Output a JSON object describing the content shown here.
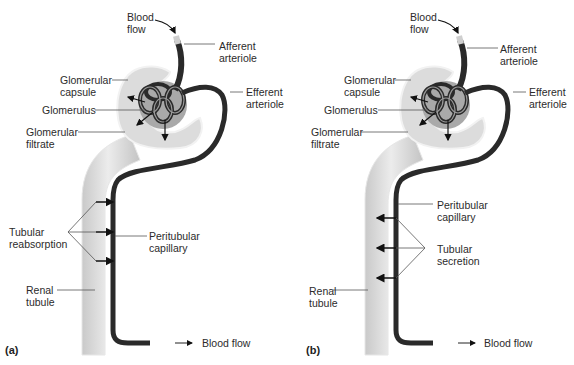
{
  "figure": {
    "panels": [
      {
        "id": "a",
        "tag": "(a)",
        "labels": {
          "blood_flow_in": [
            "Blood",
            "flow"
          ],
          "afferent_arteriole": [
            "Afferent",
            "arteriole"
          ],
          "glomerular_capsule": [
            "Glomerular",
            "capsule"
          ],
          "efferent_arteriole": [
            "Efferent",
            "arteriole"
          ],
          "glomerulus": [
            "Glomerulus"
          ],
          "glomerular_filtrate": [
            "Glomerular",
            "filtrate"
          ],
          "process": [
            "Tubular",
            "reabsorption"
          ],
          "peritubular_capillary": [
            "Peritubular",
            "capillary"
          ],
          "renal_tubule": [
            "Renal",
            "tubule"
          ],
          "blood_flow_out": [
            "Blood flow"
          ]
        },
        "transport_direction": "tubule-to-capillary"
      },
      {
        "id": "b",
        "tag": "(b)",
        "labels": {
          "blood_flow_in": [
            "Blood",
            "flow"
          ],
          "afferent_arteriole": [
            "Afferent",
            "arteriole"
          ],
          "glomerular_capsule": [
            "Glomerular",
            "capsule"
          ],
          "efferent_arteriole": [
            "Efferent",
            "arteriole"
          ],
          "glomerulus": [
            "Glomerulus"
          ],
          "glomerular_filtrate": [
            "Glomerular",
            "filtrate"
          ],
          "peritubular_capillary": [
            "Peritubular",
            "capillary"
          ],
          "process": [
            "Tubular",
            "secretion"
          ],
          "renal_tubule": [
            "Renal",
            "tubule"
          ],
          "blood_flow_out": [
            "Blood flow"
          ]
        },
        "transport_direction": "capillary-to-tubule"
      }
    ],
    "colors": {
      "vessel": "#2a2a2a",
      "tubule": "#d6d6d6",
      "capsule_inner": "#b8b8b8",
      "leader_line": "#555555"
    }
  }
}
